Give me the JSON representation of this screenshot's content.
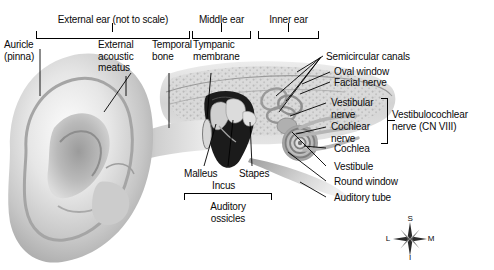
{
  "figure": {
    "background": "#ffffff",
    "ink": "#000000",
    "width": 494,
    "height": 270
  },
  "regions": [
    {
      "id": "external-ear",
      "label": "External ear (not to scale)",
      "x": 36,
      "w": 154
    },
    {
      "id": "middle-ear",
      "label": "Middle ear",
      "x": 192,
      "w": 59
    },
    {
      "id": "inner-ear",
      "label": "Inner ear",
      "x": 258,
      "w": 61
    }
  ],
  "labels": {
    "auricle": "Auricle\n(pinna)",
    "external_acoustic": "External\nacoustic\nmeatus",
    "temporal_bone": "Temporal\nbone",
    "tympanic_membrane": "Tympanic\nmembrane",
    "semicircular": "Semicircular canals",
    "oval_window": "Oval window",
    "facial_nerve": "Facial nerve",
    "vestibular_nerve": "Vestibular\nnerve",
    "cochlear_nerve": "Cochlear\nnerve",
    "vestibulocochlear": "Vestibulocochlear\nnerve (CN VIII)",
    "cochlea": "Cochlea",
    "vestibule": "Vestibule",
    "round_window": "Round window",
    "auditory_tube": "Auditory tube",
    "malleus": "Malleus",
    "incus": "Incus",
    "stapes": "Stapes",
    "auditory_ossicles": "Auditory\nossicles"
  },
  "compass": {
    "superior": "S",
    "inferior": "I",
    "lateral": "L",
    "medial": "M"
  }
}
